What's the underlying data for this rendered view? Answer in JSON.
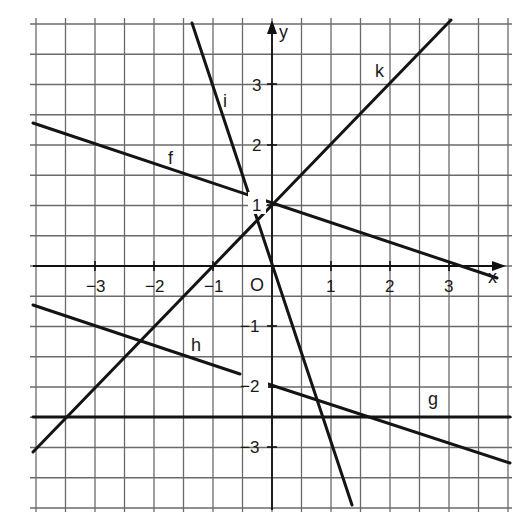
{
  "chart_data": {
    "type": "line",
    "title": "",
    "xlabel": "x",
    "ylabel": "y",
    "origin_label": "O",
    "xlim": [
      -4,
      4
    ],
    "ylim": [
      -4,
      4
    ],
    "grid": true,
    "grid_step": 0.5,
    "x_ticks": [
      -3,
      -2,
      -1,
      1,
      2,
      3
    ],
    "y_ticks": [
      3,
      2,
      1,
      -1,
      -2,
      -3
    ],
    "x_tick_labels": [
      "−3",
      "−2",
      "−1",
      "1",
      "2",
      "3"
    ],
    "y_tick_labels": [
      "3",
      "2",
      "1",
      "−1",
      "−2",
      "−3"
    ],
    "series": [
      {
        "name": "f",
        "equation": "y = -1/3 x + 1",
        "points": [
          [
            -4,
            2.33
          ],
          [
            3.6,
            -0.2
          ]
        ]
      },
      {
        "name": "g",
        "equation": "y = -2.5",
        "points": [
          [
            -4.05,
            -2.5
          ],
          [
            4.05,
            -2.5
          ]
        ]
      },
      {
        "name": "h",
        "equation": "y = -1/3 x - 2",
        "points": [
          [
            -4.05,
            -0.65
          ],
          [
            4.05,
            -3.35
          ]
        ]
      },
      {
        "name": "i",
        "equation": "y = -3x",
        "points": [
          [
            -1.36,
            4.08
          ],
          [
            1.36,
            -4.08
          ]
        ]
      },
      {
        "name": "k",
        "equation": "y = x + 1",
        "points": [
          [
            -4.05,
            -3.05
          ],
          [
            3,
            4
          ]
        ]
      }
    ]
  },
  "labels": {
    "x_axis": "x",
    "y_axis": "y",
    "origin": "O",
    "f": "f",
    "g": "g",
    "h": "h",
    "i": "i",
    "k": "k",
    "xt_m3": "−3",
    "xt_m2": "−2",
    "xt_m1": "−1",
    "xt_1": "1",
    "xt_2": "2",
    "xt_3": "3",
    "yt_3": "3",
    "yt_2": "2",
    "yt_1": "1",
    "yt_m1": "−1",
    "yt_m2": "−2",
    "yt_m3": "−3"
  }
}
